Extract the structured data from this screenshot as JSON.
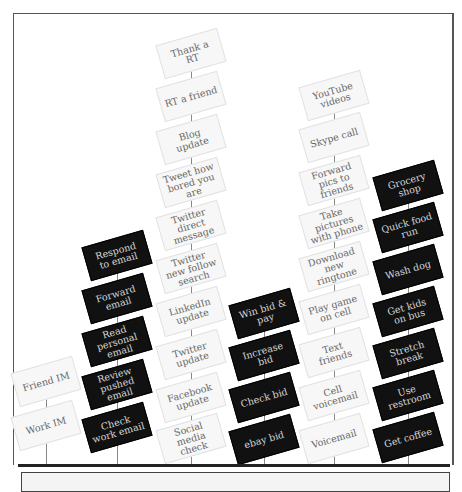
{
  "colors": {
    "dark_box": "#111111",
    "light_box": "#f7f7f7",
    "frame": "#555555",
    "baseline": "#222222"
  },
  "columns": [
    {
      "id": "im",
      "style": "light",
      "center_x": 46,
      "items": [
        "Friend IM",
        "Work IM"
      ]
    },
    {
      "id": "email",
      "style": "dark",
      "center_x": 117,
      "items": [
        "Respond to email",
        "Forward email",
        "Read personal email",
        "Review pushed email",
        "Check work email"
      ]
    },
    {
      "id": "social",
      "style": "light",
      "center_x": 191,
      "items": [
        "Thank a RT",
        "RT a friend",
        "Blog update",
        "Tweet how bored you are",
        "Twitter direct message",
        "Twitter new follow search",
        "LinkedIn update",
        "Twitter update",
        "Facebook update",
        "Social media check"
      ]
    },
    {
      "id": "ebay",
      "style": "dark",
      "center_x": 264,
      "items": [
        "Win bid & pay",
        "Increase bid",
        "Check bid",
        "ebay bid"
      ]
    },
    {
      "id": "phone",
      "style": "light",
      "center_x": 334,
      "items": [
        "YouTube videos",
        "Skype call",
        "Forward pics to friends",
        "Take pictures with phone",
        "Download new ringtone",
        "Play game on cell",
        "Text friends",
        "Cell voicemail",
        "Voicemail"
      ]
    },
    {
      "id": "errands",
      "style": "dark",
      "center_x": 408,
      "items": [
        "Grocery shop",
        "Quick food run",
        "Wash dog",
        "Get kids on bus",
        "Stretch break",
        "Use restroom",
        "Get coffee"
      ]
    }
  ]
}
